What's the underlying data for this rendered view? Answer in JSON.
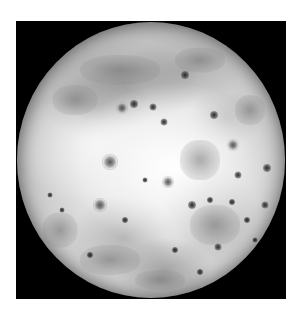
{
  "image": {
    "subject": "Io (moon) full disk, grayscale",
    "background_color": "#000000",
    "page_color": "#ffffff",
    "frame": {
      "x": 16,
      "y": 21,
      "width": 270,
      "height": 278
    },
    "disk": {
      "center_x": 151,
      "center_y": 160,
      "radius_x": 134,
      "radius_y": 138
    },
    "features": {
      "dark_spots": [
        {
          "x": 153,
          "y": 107,
          "size": 5
        },
        {
          "x": 185,
          "y": 75,
          "size": 6
        },
        {
          "x": 164,
          "y": 122,
          "size": 5
        },
        {
          "x": 238,
          "y": 175,
          "size": 5
        },
        {
          "x": 267,
          "y": 168,
          "size": 6
        },
        {
          "x": 210,
          "y": 200,
          "size": 4
        },
        {
          "x": 218,
          "y": 247,
          "size": 5
        },
        {
          "x": 200,
          "y": 272,
          "size": 4
        },
        {
          "x": 125,
          "y": 220,
          "size": 4
        },
        {
          "x": 90,
          "y": 255,
          "size": 4
        },
        {
          "x": 62,
          "y": 210,
          "size": 3
        },
        {
          "x": 265,
          "y": 205,
          "size": 5
        },
        {
          "x": 247,
          "y": 220,
          "size": 4
        },
        {
          "x": 232,
          "y": 202,
          "size": 4
        },
        {
          "x": 145,
          "y": 180,
          "size": 3
        },
        {
          "x": 192,
          "y": 205,
          "size": 6
        },
        {
          "x": 175,
          "y": 250,
          "size": 4
        },
        {
          "x": 214,
          "y": 115,
          "size": 6
        },
        {
          "x": 134,
          "y": 104,
          "size": 6
        },
        {
          "x": 255,
          "y": 240,
          "size": 3
        },
        {
          "x": 100,
          "y": 290,
          "size": 3
        },
        {
          "x": 50,
          "y": 195,
          "size": 3
        }
      ],
      "ring_craters": [
        {
          "x": 110,
          "y": 162,
          "size": 16
        },
        {
          "x": 122,
          "y": 108,
          "size": 12
        },
        {
          "x": 233,
          "y": 145,
          "size": 12
        },
        {
          "x": 100,
          "y": 205,
          "size": 14
        },
        {
          "x": 168,
          "y": 182,
          "size": 12
        }
      ],
      "dark_patches": [
        {
          "x": 120,
          "y": 70,
          "w": 80,
          "h": 30
        },
        {
          "x": 200,
          "y": 60,
          "w": 50,
          "h": 25
        },
        {
          "x": 75,
          "y": 100,
          "w": 45,
          "h": 30
        },
        {
          "x": 200,
          "y": 160,
          "w": 40,
          "h": 40
        },
        {
          "x": 215,
          "y": 225,
          "w": 50,
          "h": 40
        },
        {
          "x": 110,
          "y": 260,
          "w": 60,
          "h": 30
        },
        {
          "x": 160,
          "y": 280,
          "w": 50,
          "h": 20
        },
        {
          "x": 60,
          "y": 230,
          "w": 35,
          "h": 35
        },
        {
          "x": 250,
          "y": 110,
          "w": 30,
          "h": 30
        }
      ]
    }
  }
}
